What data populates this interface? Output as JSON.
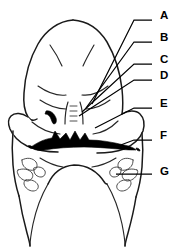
{
  "figure": {
    "background_color": "#ffffff",
    "ink_color": "#000000",
    "width": 183,
    "height": 252
  },
  "labels": [
    {
      "id": "A",
      "text": "A",
      "x": 160,
      "y": 16,
      "leader_from_x": 152,
      "leader_from_y": 20,
      "target_x": 92,
      "target_y": 104
    },
    {
      "id": "B",
      "text": "B",
      "x": 160,
      "y": 38,
      "leader_from_x": 152,
      "leader_from_y": 42,
      "target_x": 86,
      "target_y": 108
    },
    {
      "id": "C",
      "text": "C",
      "x": 160,
      "y": 60,
      "leader_from_x": 152,
      "leader_from_y": 64,
      "target_x": 82,
      "target_y": 112
    },
    {
      "id": "D",
      "text": "D",
      "x": 160,
      "y": 76,
      "leader_from_x": 152,
      "leader_from_y": 80,
      "target_x": 79,
      "target_y": 116
    },
    {
      "id": "E",
      "text": "E",
      "x": 160,
      "y": 104,
      "leader_from_x": 152,
      "leader_from_y": 108,
      "target_x": 95,
      "target_y": 128
    },
    {
      "id": "F",
      "text": "F",
      "x": 160,
      "y": 136,
      "leader_from_x": 152,
      "leader_from_y": 140,
      "target_x": 118,
      "target_y": 146
    },
    {
      "id": "G",
      "text": "G",
      "x": 160,
      "y": 172,
      "leader_from_x": 152,
      "leader_from_y": 174,
      "target_x": 116,
      "target_y": 174
    }
  ]
}
